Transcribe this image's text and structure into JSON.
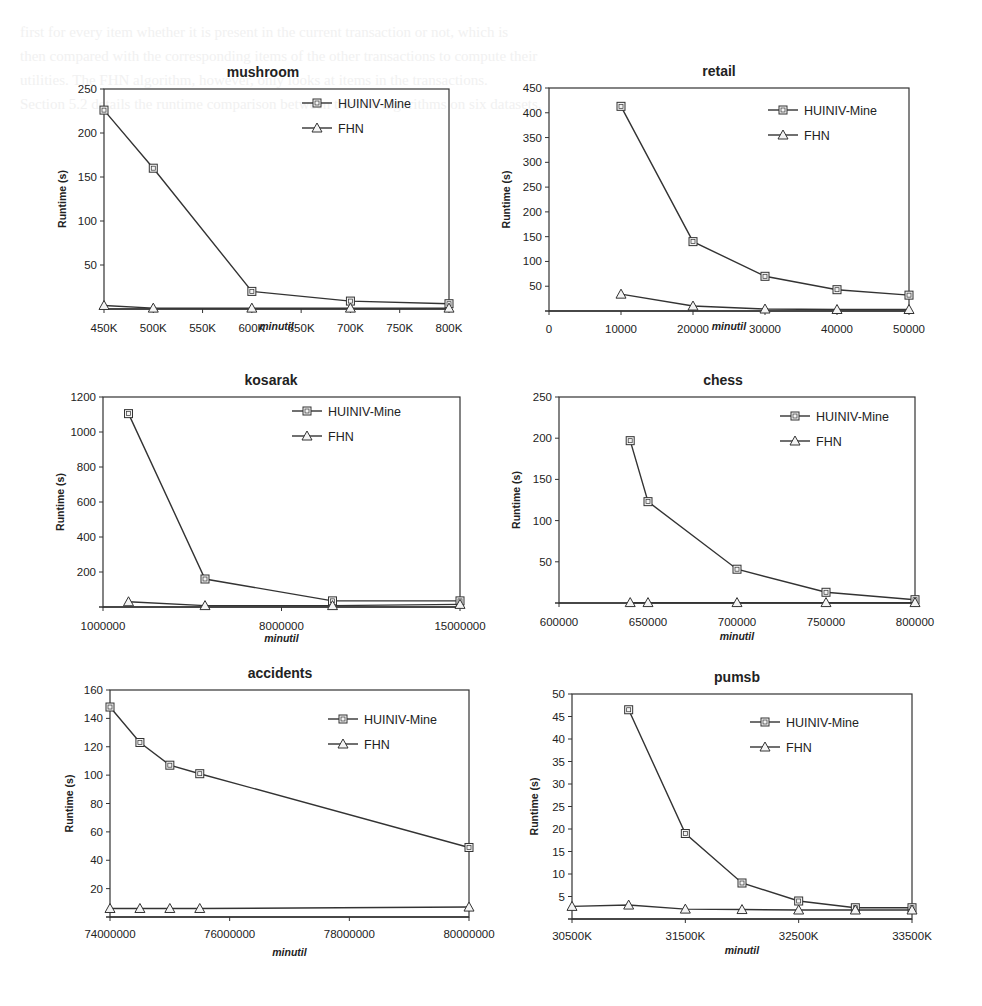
{
  "series_names": [
    "HUINIV-Mine",
    "FHN"
  ],
  "ylabel": "Runtime (s)",
  "xlabel": "minutil",
  "chart_data": [
    {
      "type": "line",
      "title": "mushroom",
      "xlabel": "minutil",
      "ylabel": "Runtime (s)",
      "x_ticks": [
        "450K",
        "500K",
        "550K",
        "600K",
        "650K",
        "700K",
        "750K",
        "800K"
      ],
      "y_ticks": [
        50,
        100,
        150,
        200,
        250
      ],
      "ylim": [
        0,
        250
      ],
      "xlim": [
        450000,
        800000
      ],
      "x": [
        450000,
        500000,
        600000,
        700000,
        800000
      ],
      "series": [
        {
          "name": "HUINIV-Mine",
          "marker": "square",
          "values": [
            226,
            160,
            20,
            9,
            6
          ]
        },
        {
          "name": "FHN",
          "marker": "triangle",
          "values": [
            4,
            1,
            1,
            1,
            1
          ]
        }
      ],
      "legend_position": "upper right",
      "grid": false
    },
    {
      "type": "line",
      "title": "retail",
      "xlabel": "minutil",
      "ylabel": "Runtime (s)",
      "x_ticks": [
        "0",
        "10000",
        "20000",
        "30000",
        "40000",
        "50000"
      ],
      "y_ticks": [
        50,
        100,
        150,
        200,
        250,
        300,
        350,
        400,
        450
      ],
      "ylim": [
        0,
        450
      ],
      "xlim": [
        0,
        50000
      ],
      "x": [
        10000,
        20000,
        30000,
        40000,
        50000
      ],
      "series": [
        {
          "name": "HUINIV-Mine",
          "marker": "square",
          "values": [
            413,
            140,
            70,
            43,
            32
          ]
        },
        {
          "name": "FHN",
          "marker": "triangle",
          "values": [
            34,
            10,
            4,
            3,
            3
          ]
        }
      ],
      "legend_position": "upper right",
      "grid": false
    },
    {
      "type": "line",
      "title": "kosarak",
      "xlabel": "minutil",
      "ylabel": "Runtime (s)",
      "x_ticks": [
        "1000000",
        "8000000",
        "15000000"
      ],
      "y_ticks": [
        200,
        400,
        600,
        800,
        1000,
        1200
      ],
      "ylim": [
        0,
        1200
      ],
      "xlim": [
        1000000,
        15000000
      ],
      "x": [
        2000000,
        5000000,
        10000000,
        15000000
      ],
      "series": [
        {
          "name": "HUINIV-Mine",
          "marker": "square",
          "values": [
            1105,
            160,
            35,
            35
          ]
        },
        {
          "name": "FHN",
          "marker": "triangle",
          "values": [
            30,
            8,
            8,
            15
          ]
        }
      ],
      "legend_position": "upper right",
      "grid": false
    },
    {
      "type": "line",
      "title": "chess",
      "xlabel": "minutil",
      "ylabel": "Runtime (s)",
      "x_ticks": [
        "600000",
        "650000",
        "700000",
        "750000",
        "800000"
      ],
      "y_ticks": [
        50,
        100,
        150,
        200,
        250
      ],
      "ylim": [
        0,
        250
      ],
      "xlim": [
        600000,
        800000
      ],
      "x": [
        640000,
        650000,
        700000,
        750000,
        800000
      ],
      "series": [
        {
          "name": "HUINIV-Mine",
          "marker": "square",
          "values": [
            197,
            123,
            41,
            13,
            4
          ]
        },
        {
          "name": "FHN",
          "marker": "triangle",
          "values": [
            0.5,
            0.5,
            0.5,
            0.5,
            0.5
          ]
        }
      ],
      "legend_position": "upper right",
      "grid": false
    },
    {
      "type": "line",
      "title": "accidents",
      "xlabel": "minutil",
      "ylabel": "Runtime (s)",
      "x_ticks": [
        "74000000",
        "76000000",
        "78000000",
        "80000000"
      ],
      "y_ticks": [
        20,
        40,
        60,
        80,
        100,
        120,
        140,
        160
      ],
      "ylim": [
        0,
        160
      ],
      "xlim": [
        74000000,
        80000000
      ],
      "x": [
        74000000,
        74500000,
        75000000,
        75500000,
        80000000
      ],
      "series": [
        {
          "name": "HUINIV-Mine",
          "marker": "square",
          "values": [
            148,
            123,
            107,
            101,
            49
          ]
        },
        {
          "name": "FHN",
          "marker": "triangle",
          "values": [
            6,
            6,
            6,
            6,
            7
          ]
        }
      ],
      "legend_position": "upper right",
      "grid": false
    },
    {
      "type": "line",
      "title": "pumsb",
      "xlabel": "minutil",
      "ylabel": "Runtime (s)",
      "x_ticks": [
        "30500K",
        "31500K",
        "32500K",
        "33500K"
      ],
      "y_ticks": [
        5,
        10,
        15,
        20,
        25,
        30,
        35,
        40,
        45,
        50
      ],
      "ylim": [
        0,
        50
      ],
      "xlim": [
        30500000,
        33500000
      ],
      "x": [
        30500000,
        31000000,
        31500000,
        32000000,
        32500000,
        33000000,
        33500000
      ],
      "series": [
        {
          "name": "HUINIV-Mine",
          "marker": "square",
          "values": [
            null,
            46.5,
            19,
            8,
            4,
            2.5,
            2.5
          ]
        },
        {
          "name": "FHN",
          "marker": "triangle",
          "values": [
            2.8,
            3.1,
            2.2,
            2.1,
            2,
            2,
            2
          ]
        }
      ],
      "legend_position": "upper right",
      "grid": false
    }
  ],
  "layout": [
    {
      "box": [
        104,
        89,
        449,
        309
      ],
      "title_pos": [
        263,
        77
      ],
      "legend": [
        302,
        103
      ],
      "ylabel_x": 66,
      "xlabel_y": 330,
      "xtick_y": 332
    },
    {
      "box": [
        549,
        88,
        909,
        311
      ],
      "title_pos": [
        719,
        76
      ],
      "legend": [
        768,
        110
      ],
      "ylabel_x": 510,
      "xlabel_y": 330,
      "xtick_y": 333
    },
    {
      "box": [
        103,
        397,
        460,
        607
      ],
      "title_pos": [
        271,
        385
      ],
      "legend": [
        292,
        411
      ],
      "ylabel_x": 64,
      "xlabel_y": 642,
      "xtick_y": 630
    },
    {
      "box": [
        559,
        397,
        915,
        603
      ],
      "title_pos": [
        723,
        385
      ],
      "legend": [
        780,
        416
      ],
      "ylabel_x": 520,
      "xlabel_y": 640,
      "xtick_y": 626
    },
    {
      "box": [
        110,
        690,
        469,
        917
      ],
      "title_pos": [
        280,
        678
      ],
      "legend": [
        328,
        719
      ],
      "ylabel_x": 73,
      "xlabel_y": 956,
      "xtick_y": 938
    },
    {
      "box": [
        572,
        694,
        912,
        919
      ],
      "title_pos": [
        737,
        682
      ],
      "legend": [
        750,
        722
      ],
      "ylabel_x": 538,
      "xlabel_y": 954,
      "xtick_y": 940
    }
  ],
  "background_text_lines": [
    "first for every item whether it is present in the current transaction or not, which is",
    "then compared with the corresponding items of the other transactions to compute their",
    "utilities. The FHN algorithm, however, only looks at items in the transactions.",
    "Section 5.2 details the runtime comparison between the two algorithms on six datasets."
  ]
}
